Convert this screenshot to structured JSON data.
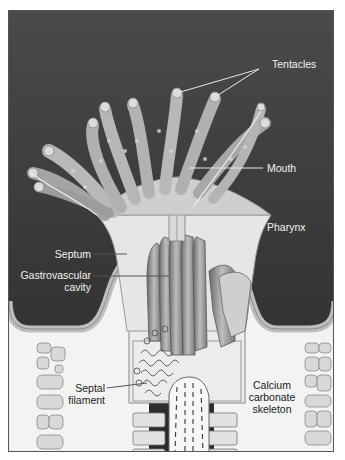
{
  "figure": {
    "colors": {
      "background_dark": "#3a3a3a",
      "tissue_light": "#d9d9d9",
      "tissue_mid": "#a8a8a8",
      "skeleton": "#f4f4f4",
      "leader_line_light": "#e8e8e8",
      "leader_line_dark": "#444444",
      "border": "#555555"
    },
    "labels": {
      "tentacles": "Tentacles",
      "mouth": "Mouth",
      "pharynx": "Pharynx",
      "septum": "Septum",
      "gastrovascular_line1": "Gastrovascular",
      "gastrovascular_line2": "cavity",
      "septal_line1": "Septal",
      "septal_line2": "filament",
      "calcium_line1": "Calcium",
      "calcium_line2": "carbonate",
      "calcium_line3": "skeleton"
    }
  }
}
